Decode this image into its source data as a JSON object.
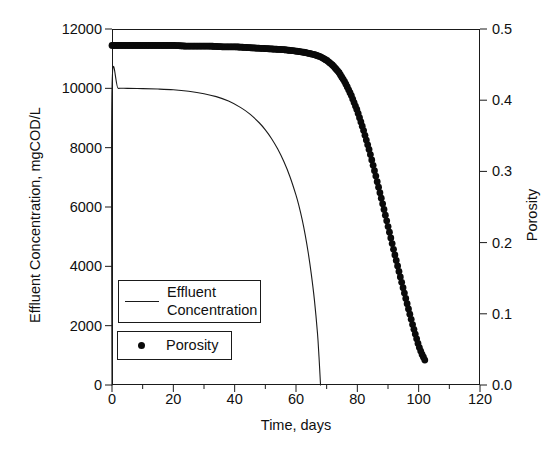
{
  "chart_data": {
    "type": "line",
    "title": "",
    "xlabel": "Time, days",
    "ylabel": "Effluent Concentration, mgCOD/L",
    "y2label": "Porosity",
    "xlim": [
      0,
      120
    ],
    "ylim": [
      0,
      12000
    ],
    "y2lim": [
      0.0,
      0.5
    ],
    "grid": false,
    "xticks": [
      0,
      20,
      40,
      60,
      80,
      100,
      120
    ],
    "xtick_labels": [
      "0",
      "20",
      "40",
      "60",
      "80",
      "100",
      "120"
    ],
    "xminor_ticks": [
      10,
      30,
      50,
      70,
      90,
      110
    ],
    "yticks": [
      0,
      2000,
      4000,
      6000,
      8000,
      10000,
      12000
    ],
    "ytick_labels": [
      "0",
      "2000",
      "4000",
      "6000",
      "8000",
      "10000",
      "12000"
    ],
    "y2ticks": [
      0.0,
      0.1,
      0.2,
      0.3,
      0.4,
      0.5
    ],
    "y2tick_labels": [
      "0.0",
      "0.1",
      "0.2",
      "0.3",
      "0.4",
      "0.5"
    ],
    "legend_position": "lower-left-inside",
    "series": [
      {
        "name": "Effluent Concentration",
        "axis": "left",
        "style": "thin-line",
        "color": "#1a1a1a",
        "x": [
          0,
          0,
          2,
          5,
          10,
          15,
          20,
          25,
          30,
          34,
          38,
          42,
          45,
          48,
          50,
          52,
          54,
          56,
          58,
          60,
          61,
          62,
          63,
          64,
          65,
          66,
          67,
          67.5,
          68
        ],
        "y": [
          0,
          10000,
          10000,
          10000,
          9990,
          9975,
          9950,
          9900,
          9820,
          9720,
          9570,
          9350,
          9130,
          8840,
          8600,
          8310,
          7960,
          7540,
          7030,
          6400,
          6020,
          5580,
          5060,
          4450,
          3730,
          2870,
          1750,
          950,
          0
        ]
      },
      {
        "name": "Porosity",
        "axis": "right",
        "style": "thick-dotted",
        "color": "#0a0a0a",
        "x": [
          0,
          4,
          8,
          12,
          16,
          20,
          24,
          28,
          32,
          36,
          40,
          44,
          48,
          52,
          56,
          60,
          63,
          66,
          68,
          70,
          72,
          74,
          76,
          78,
          80,
          82,
          84,
          86,
          88,
          90,
          92,
          94,
          96,
          98,
          100,
          101,
          102
        ],
        "y": [
          0.477,
          0.477,
          0.477,
          0.477,
          0.477,
          0.477,
          0.476,
          0.476,
          0.476,
          0.475,
          0.475,
          0.474,
          0.473,
          0.472,
          0.471,
          0.469,
          0.467,
          0.464,
          0.461,
          0.456,
          0.449,
          0.439,
          0.425,
          0.407,
          0.385,
          0.358,
          0.328,
          0.294,
          0.259,
          0.223,
          0.187,
          0.152,
          0.118,
          0.085,
          0.055,
          0.044,
          0.035
        ]
      }
    ]
  },
  "legend": {
    "entries": [
      {
        "label_line1": "Effluent",
        "label_line2": "Concentration",
        "marker": "line-swatch"
      },
      {
        "label_line1": "Porosity",
        "label_line2": "",
        "marker": "dot-swatch"
      }
    ]
  }
}
